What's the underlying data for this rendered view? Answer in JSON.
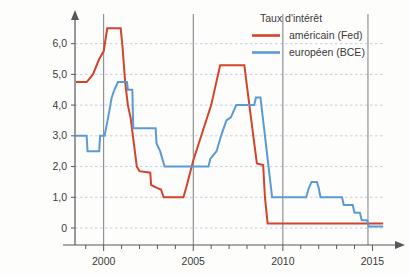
{
  "chart_data": {
    "type": "line",
    "title": "",
    "xlabel": "",
    "ylabel": "",
    "xlim": [
      1998.4,
      2015.7
    ],
    "ylim": [
      0,
      6.9
    ],
    "grid": true,
    "y_ticks": [
      0,
      1,
      2,
      3,
      4,
      5,
      6
    ],
    "y_tick_labels": [
      "0",
      "1,0",
      "2,0",
      "3,0",
      "4,0",
      "5,0",
      "6,0"
    ],
    "x_ticks": [
      2000,
      2005,
      2010,
      2015
    ],
    "x_tick_labels": [
      "2000",
      "2005",
      "2010",
      "2015"
    ],
    "x_minor_tick_step": 1,
    "marker_lines": [
      2000,
      2005,
      2010,
      2014.75
    ],
    "legend": {
      "title": "Taux d'intérêt",
      "position": "top-right",
      "entries": [
        {
          "name": "américain (Fed)",
          "color": "#d4432a"
        },
        {
          "name": "européen (BCE)",
          "color": "#5b9bd5"
        }
      ]
    },
    "series": [
      {
        "name": "américain (Fed)",
        "color": "#d4432a",
        "style": "step",
        "points": [
          [
            1998.45,
            4.75
          ],
          [
            1999.0,
            4.75
          ],
          [
            1999.05,
            4.75
          ],
          [
            1999.4,
            5.0
          ],
          [
            1999.75,
            5.5
          ],
          [
            2000.0,
            5.75
          ],
          [
            2000.2,
            6.5
          ],
          [
            2000.95,
            6.5
          ],
          [
            2001.05,
            5.9
          ],
          [
            2001.2,
            4.75
          ],
          [
            2001.35,
            4.0
          ],
          [
            2001.5,
            3.6
          ],
          [
            2001.85,
            2.0
          ],
          [
            2002.0,
            1.85
          ],
          [
            2002.6,
            1.8
          ],
          [
            2002.65,
            1.4
          ],
          [
            2003.0,
            1.3
          ],
          [
            2003.2,
            1.25
          ],
          [
            2003.35,
            1.0
          ],
          [
            2004.45,
            1.0
          ],
          [
            2004.6,
            1.3
          ],
          [
            2005.0,
            2.2
          ],
          [
            2005.5,
            3.1
          ],
          [
            2006.0,
            4.0
          ],
          [
            2006.5,
            5.3
          ],
          [
            2007.85,
            5.3
          ],
          [
            2008.0,
            4.6
          ],
          [
            2008.35,
            3.0
          ],
          [
            2008.55,
            2.1
          ],
          [
            2008.9,
            2.05
          ],
          [
            2009.0,
            1.0
          ],
          [
            2009.15,
            0.15
          ],
          [
            2015.6,
            0.15
          ]
        ]
      },
      {
        "name": "européen (BCE)",
        "color": "#5b9bd5",
        "style": "step",
        "points": [
          [
            1998.45,
            3.0
          ],
          [
            1999.05,
            3.0
          ],
          [
            1999.1,
            2.5
          ],
          [
            1999.75,
            2.5
          ],
          [
            1999.8,
            3.0
          ],
          [
            2000.05,
            3.0
          ],
          [
            2000.25,
            3.6
          ],
          [
            2000.45,
            4.25
          ],
          [
            2000.6,
            4.5
          ],
          [
            2000.8,
            4.75
          ],
          [
            2001.3,
            4.75
          ],
          [
            2001.35,
            4.5
          ],
          [
            2001.6,
            4.5
          ],
          [
            2001.65,
            3.25
          ],
          [
            2002.9,
            3.25
          ],
          [
            2002.95,
            2.75
          ],
          [
            2003.15,
            2.5
          ],
          [
            2003.4,
            2.0
          ],
          [
            2005.85,
            2.0
          ],
          [
            2005.95,
            2.25
          ],
          [
            2006.3,
            2.5
          ],
          [
            2006.55,
            3.0
          ],
          [
            2006.85,
            3.5
          ],
          [
            2007.1,
            3.6
          ],
          [
            2007.4,
            4.0
          ],
          [
            2008.4,
            4.0
          ],
          [
            2008.5,
            4.25
          ],
          [
            2008.75,
            4.25
          ],
          [
            2008.95,
            3.25
          ],
          [
            2009.4,
            1.0
          ],
          [
            2011.3,
            1.0
          ],
          [
            2011.45,
            1.3
          ],
          [
            2011.6,
            1.5
          ],
          [
            2011.9,
            1.5
          ],
          [
            2012.0,
            1.3
          ],
          [
            2012.1,
            1.0
          ],
          [
            2013.3,
            1.0
          ],
          [
            2013.4,
            0.75
          ],
          [
            2013.9,
            0.75
          ],
          [
            2014.0,
            0.5
          ],
          [
            2014.3,
            0.5
          ],
          [
            2014.4,
            0.25
          ],
          [
            2014.7,
            0.25
          ],
          [
            2014.8,
            0.05
          ],
          [
            2015.6,
            0.05
          ]
        ]
      }
    ]
  }
}
